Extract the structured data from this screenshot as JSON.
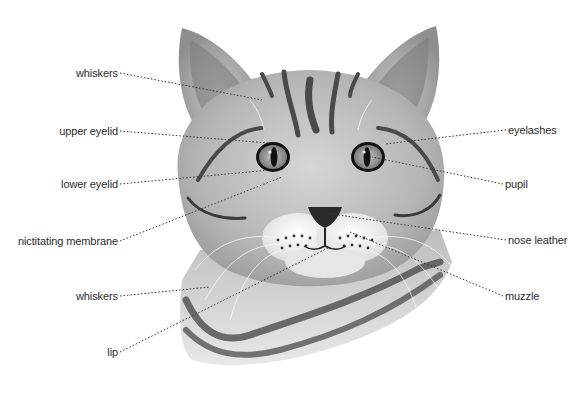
{
  "diagram": {
    "colors": {
      "background": "#ffffff",
      "fur_light": "#d9d9d9",
      "fur_mid": "#a8a8a8",
      "stripe": "#4a4a4a",
      "leader_line": "#333333",
      "label_text": "#2b2b2b"
    },
    "labels_left": [
      {
        "text": "whiskers",
        "x": 118,
        "y": 73,
        "target": [
          262,
          100
        ]
      },
      {
        "text": "upper eyelid",
        "x": 118,
        "y": 131,
        "target": [
          268,
          143
        ]
      },
      {
        "text": "lower eyelid",
        "x": 118,
        "y": 184,
        "target": [
          270,
          170
        ]
      },
      {
        "text": "nictitating membrane",
        "x": 118,
        "y": 241,
        "target": [
          282,
          177
        ]
      },
      {
        "text": "whiskers",
        "x": 118,
        "y": 296,
        "target": [
          210,
          287
        ]
      },
      {
        "text": "lip",
        "x": 118,
        "y": 352,
        "target": [
          328,
          248
        ]
      }
    ],
    "labels_right": [
      {
        "text": "eyelashes",
        "x": 508,
        "y": 130,
        "target": [
          385,
          144
        ]
      },
      {
        "text": "pupil",
        "x": 505,
        "y": 184,
        "target": [
          372,
          157
        ]
      },
      {
        "text": "nose leather",
        "x": 508,
        "y": 240,
        "target": [
          325,
          213
        ]
      },
      {
        "text": "muzzle",
        "x": 505,
        "y": 296,
        "target": [
          350,
          232
        ]
      }
    ]
  }
}
